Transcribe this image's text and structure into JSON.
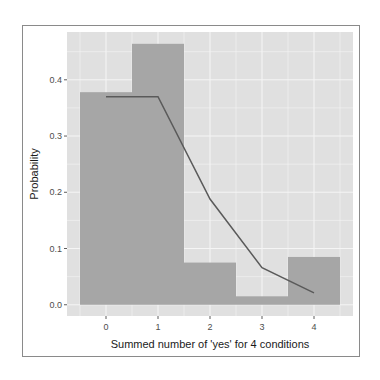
{
  "chart_data": {
    "type": "bar",
    "title": "",
    "xlabel": "Summed number of 'yes' for 4 conditions",
    "ylabel": "Probability",
    "categories": [
      "0",
      "1",
      "2",
      "3",
      "4"
    ],
    "series": [
      {
        "name": "observed",
        "kind": "bar",
        "values": [
          0.378,
          0.464,
          0.075,
          0.015,
          0.085
        ],
        "color": "#a6a6a6"
      },
      {
        "name": "expected",
        "kind": "line",
        "values": [
          0.37,
          0.37,
          0.188,
          0.066,
          0.021
        ],
        "color": "#5a5a5a"
      }
    ],
    "x_ticks": [
      "0",
      "1",
      "2",
      "3",
      "4"
    ],
    "y_ticks": [
      "0.0",
      "0.1",
      "0.2",
      "0.3",
      "0.4"
    ],
    "ylim": [
      -0.02,
      0.485
    ],
    "xlim": [
      -0.75,
      4.75
    ],
    "grid": true,
    "legend": "none",
    "panel_background": "#e0e0e0",
    "grid_color": "#f5f5f5"
  }
}
